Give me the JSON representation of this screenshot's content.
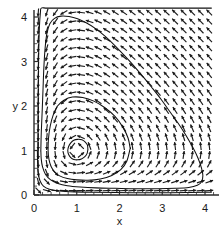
{
  "figure": {
    "kind": "phase-portrait",
    "background_color": "#ffffff",
    "line_color": "#111111",
    "arrow_color": "#1b1b1b",
    "axis_color": "#2b2b2b"
  },
  "chart_data": {
    "type": "scatter",
    "title": "",
    "subtitle": "",
    "xlabel": "x",
    "ylabel": "y",
    "xlim": [
      0,
      4.2
    ],
    "ylim": [
      0,
      4.3
    ],
    "grid": false,
    "legend": null,
    "x_ticks": [
      0,
      1,
      2,
      3,
      4
    ],
    "x_tick_labels": [
      "0",
      "1",
      "2",
      "3",
      "4"
    ],
    "y_ticks": [
      0,
      1,
      2,
      3,
      4
    ],
    "y_tick_labels": [
      "0",
      "1",
      "2",
      "3",
      "4"
    ],
    "minor_ticks_per_unit": 5,
    "fixed_point": {
      "x": 1,
      "y": 1,
      "type": "center"
    },
    "vector_field": {
      "description": "normalized direction field of a Lotka-Volterra predator-prey system",
      "dx_expression": "x*(1 - y)",
      "dy_expression": "y*(x - 1)",
      "grid_x_start": 0.1,
      "grid_x_end": 4.1,
      "grid_y_start": 0.1,
      "grid_y_end": 4.2,
      "grid_step": 0.2,
      "arrow_length_px": 8,
      "rotation_sense": "counterclockwise"
    },
    "orbits": [
      {
        "name": "inner-orbit",
        "level": 0.06,
        "x_range": [
          0.78,
          1.26
        ],
        "y_range": [
          0.79,
          1.25
        ],
        "points": [
          [
            1.26,
            1.02
          ],
          [
            1.25,
            1.12
          ],
          [
            1.2,
            1.19
          ],
          [
            1.12,
            1.24
          ],
          [
            1.02,
            1.25
          ],
          [
            0.93,
            1.23
          ],
          [
            0.86,
            1.17
          ],
          [
            0.81,
            1.09
          ],
          [
            0.79,
            1.0
          ],
          [
            0.81,
            0.91
          ],
          [
            0.86,
            0.84
          ],
          [
            0.93,
            0.8
          ],
          [
            1.02,
            0.79
          ],
          [
            1.11,
            0.81
          ],
          [
            1.19,
            0.86
          ],
          [
            1.24,
            0.93
          ],
          [
            1.26,
            1.02
          ]
        ]
      },
      {
        "name": "middle-orbit",
        "level": 0.55,
        "x_range": [
          0.33,
          2.25
        ],
        "y_range": [
          0.33,
          2.2
        ],
        "points": [
          [
            2.25,
            1.05
          ],
          [
            2.2,
            1.28
          ],
          [
            2.08,
            1.52
          ],
          [
            1.9,
            1.76
          ],
          [
            1.66,
            1.96
          ],
          [
            1.4,
            2.11
          ],
          [
            1.14,
            2.19
          ],
          [
            0.9,
            2.2
          ],
          [
            0.7,
            2.13
          ],
          [
            0.55,
            2.0
          ],
          [
            0.45,
            1.8
          ],
          [
            0.38,
            1.55
          ],
          [
            0.34,
            1.28
          ],
          [
            0.33,
            1.0
          ],
          [
            0.35,
            0.8
          ],
          [
            0.4,
            0.64
          ],
          [
            0.48,
            0.52
          ],
          [
            0.6,
            0.43
          ],
          [
            0.78,
            0.37
          ],
          [
            1.0,
            0.34
          ],
          [
            1.26,
            0.33
          ],
          [
            1.55,
            0.36
          ],
          [
            1.82,
            0.44
          ],
          [
            2.03,
            0.57
          ],
          [
            2.17,
            0.76
          ],
          [
            2.25,
            1.05
          ]
        ]
      },
      {
        "name": "outer-orbit",
        "level": 2.2,
        "x_range": [
          0.16,
          3.95
        ],
        "y_range": [
          0.14,
          4.02
        ],
        "points": [
          [
            0.16,
            1.0
          ],
          [
            0.17,
            1.4
          ],
          [
            0.19,
            1.85
          ],
          [
            0.21,
            2.35
          ],
          [
            0.23,
            2.85
          ],
          [
            0.26,
            3.3
          ],
          [
            0.3,
            3.62
          ],
          [
            0.37,
            3.85
          ],
          [
            0.48,
            3.97
          ],
          [
            0.63,
            4.02
          ],
          [
            0.82,
            4.01
          ],
          [
            1.02,
            3.96
          ],
          [
            1.22,
            3.87
          ],
          [
            1.44,
            3.74
          ],
          [
            1.66,
            3.57
          ],
          [
            1.88,
            3.37
          ],
          [
            2.1,
            3.15
          ],
          [
            2.32,
            2.92
          ],
          [
            2.54,
            2.67
          ],
          [
            2.76,
            2.41
          ],
          [
            2.98,
            2.14
          ],
          [
            3.18,
            1.87
          ],
          [
            3.38,
            1.6
          ],
          [
            3.56,
            1.33
          ],
          [
            3.72,
            1.06
          ],
          [
            3.84,
            0.82
          ],
          [
            3.92,
            0.6
          ],
          [
            3.95,
            0.43
          ],
          [
            3.92,
            0.3
          ],
          [
            3.82,
            0.22
          ],
          [
            3.62,
            0.17
          ],
          [
            3.3,
            0.15
          ],
          [
            2.9,
            0.14
          ],
          [
            2.4,
            0.14
          ],
          [
            1.9,
            0.15
          ],
          [
            1.45,
            0.16
          ],
          [
            1.08,
            0.18
          ],
          [
            0.78,
            0.21
          ],
          [
            0.56,
            0.26
          ],
          [
            0.39,
            0.34
          ],
          [
            0.27,
            0.46
          ],
          [
            0.2,
            0.63
          ],
          [
            0.17,
            0.8
          ],
          [
            0.16,
            1.0
          ]
        ]
      },
      {
        "name": "near-axis-orbit-lower",
        "level": 3.1,
        "x_range": [
          0.09,
          4.15
        ],
        "y_range": [
          0.06,
          4.2
        ],
        "points": [
          [
            0.09,
            1.0
          ],
          [
            0.095,
            1.7
          ],
          [
            0.1,
            2.5
          ],
          [
            0.11,
            3.2
          ],
          [
            0.125,
            3.75
          ],
          [
            0.15,
            4.1
          ],
          [
            0.17,
            4.2
          ],
          [
            0.3,
            4.2
          ],
          [
            0.6,
            4.2
          ],
          [
            1.0,
            4.2
          ],
          [
            1.5,
            4.2
          ],
          [
            2.0,
            4.2
          ],
          [
            2.6,
            4.2
          ],
          [
            3.2,
            4.2
          ],
          [
            3.8,
            4.2
          ],
          [
            4.15,
            4.2
          ]
        ]
      },
      {
        "name": "near-axis-orbit-bottom",
        "level": 3.4,
        "x_range": [
          0.08,
          4.15
        ],
        "y_range": [
          0.05,
          1.0
        ],
        "points": [
          [
            0.08,
            1.0
          ],
          [
            0.085,
            0.7
          ],
          [
            0.1,
            0.48
          ],
          [
            0.14,
            0.32
          ],
          [
            0.22,
            0.2
          ],
          [
            0.36,
            0.13
          ],
          [
            0.6,
            0.09
          ],
          [
            0.95,
            0.07
          ],
          [
            1.4,
            0.06
          ],
          [
            1.9,
            0.055
          ],
          [
            2.45,
            0.05
          ],
          [
            3.0,
            0.05
          ],
          [
            3.55,
            0.055
          ],
          [
            4.0,
            0.06
          ],
          [
            4.15,
            0.065
          ]
        ]
      }
    ]
  },
  "axes": {
    "x_axis_name": "x-axis",
    "y_axis_name": "y-axis",
    "x_label": "x",
    "y_label": "y"
  }
}
